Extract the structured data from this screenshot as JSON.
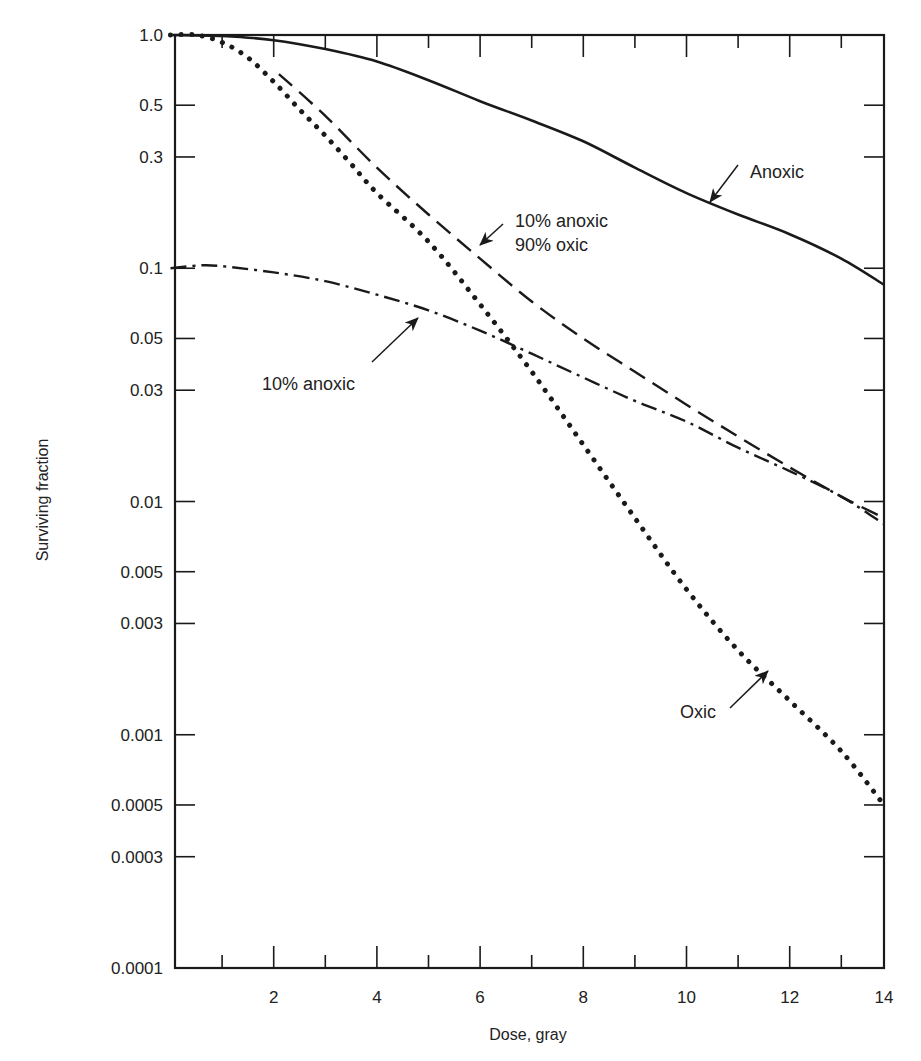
{
  "chart_data": {
    "type": "line",
    "title": "",
    "xlabel": "Dose, gray",
    "ylabel": "Surviving fraction",
    "xlim": [
      0,
      14
    ],
    "ylim": [
      0.0001,
      1.0
    ],
    "yscale": "log",
    "grid": false,
    "legend": "none (inline arrow annotations)",
    "x_ticks": [
      2,
      4,
      6,
      8,
      10,
      12,
      14
    ],
    "x_tick_labels": [
      "2",
      "4",
      "6",
      "8",
      "10",
      "12",
      "14"
    ],
    "x_minor_ticks": [
      1,
      3,
      5,
      7,
      9,
      11,
      13
    ],
    "y_ticks": [
      1.0,
      0.5,
      0.3,
      0.1,
      0.05,
      0.03,
      0.01,
      0.005,
      0.003,
      0.001,
      0.0005,
      0.0003,
      0.0001
    ],
    "y_tick_labels": [
      "1.0",
      "0.5",
      "0.3",
      "0.1",
      "0.05",
      "0.03",
      "0.01",
      "0.005",
      "0.003",
      "0.001",
      "0.0005",
      "0.0003",
      "0.0001"
    ],
    "series": [
      {
        "name": "Anoxic",
        "style": "solid",
        "x": [
          0,
          1,
          2,
          3,
          4,
          5,
          6,
          7,
          8,
          9,
          10,
          11,
          12,
          13,
          14
        ],
        "y": [
          1.0,
          0.99,
          0.95,
          0.87,
          0.77,
          0.64,
          0.52,
          0.43,
          0.35,
          0.27,
          0.21,
          0.17,
          0.14,
          0.11,
          0.085
        ]
      },
      {
        "name": "10% anoxic 90% oxic",
        "style": "dashed",
        "x": [
          2.1,
          3,
          4,
          5,
          6,
          7,
          8,
          9,
          10,
          11,
          12,
          13,
          14
        ],
        "y": [
          0.68,
          0.45,
          0.27,
          0.17,
          0.11,
          0.072,
          0.05,
          0.036,
          0.026,
          0.019,
          0.014,
          0.0105,
          0.0085
        ]
      },
      {
        "name": "10% anoxic",
        "style": "dash-dot",
        "x": [
          0,
          0.6,
          1,
          2,
          3,
          4,
          5,
          6,
          7,
          8,
          9,
          10,
          11,
          12,
          13,
          14
        ],
        "y": [
          0.1,
          0.103,
          0.102,
          0.096,
          0.088,
          0.077,
          0.066,
          0.054,
          0.043,
          0.034,
          0.027,
          0.022,
          0.017,
          0.0135,
          0.0105,
          0.008
        ]
      },
      {
        "name": "Oxic",
        "style": "dotted",
        "x": [
          0,
          0.5,
          1,
          1.5,
          2,
          2.5,
          3,
          3.5,
          4,
          5,
          6,
          7,
          8,
          9,
          10,
          11,
          12,
          13,
          14
        ],
        "y": [
          1.0,
          1.0,
          0.93,
          0.8,
          0.63,
          0.48,
          0.37,
          0.28,
          0.21,
          0.13,
          0.07,
          0.036,
          0.0175,
          0.0085,
          0.0042,
          0.0023,
          0.0014,
          0.00085,
          0.0005
        ]
      }
    ],
    "annotations": [
      {
        "text": "Anoxic",
        "text_x": 750,
        "text_y": 178,
        "arrow_from": [
          738,
          165
        ],
        "arrow_to": [
          710,
          202
        ]
      },
      {
        "text_lines": [
          "10% anoxic",
          "90% oxic"
        ],
        "text_x": 515,
        "text_y": 227,
        "arrow_from": [
          503,
          224
        ],
        "arrow_to": [
          480,
          245
        ]
      },
      {
        "text": "10% anoxic",
        "text_x": 262,
        "text_y": 390,
        "arrow_from": [
          372,
          362
        ],
        "arrow_to": [
          418,
          318
        ]
      },
      {
        "text": "Oxic",
        "text_x": 680,
        "text_y": 718,
        "arrow_from": [
          730,
          708
        ],
        "arrow_to": [
          768,
          671
        ]
      }
    ]
  },
  "axes": {
    "x_title": "Dose, gray",
    "y_title": "Surviving fraction"
  }
}
